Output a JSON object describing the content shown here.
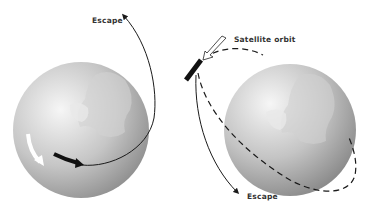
{
  "diagram": {
    "left_panel": {
      "label_escape": "Escape",
      "globe": {
        "cx": 81,
        "cy": 130,
        "r": 68
      },
      "trajectory": "escape"
    },
    "right_panel": {
      "label_orbit": "Satellite orbit",
      "label_escape": "Escape",
      "globe": {
        "cx": 286,
        "cy": 127,
        "r": 68
      },
      "trajectory": "orbit-and-escape"
    },
    "colors": {
      "globe_light": "#f4f4f4",
      "globe_dark": "#8e8e8e",
      "line": "#1a1a1a",
      "background": "#ffffff"
    }
  }
}
